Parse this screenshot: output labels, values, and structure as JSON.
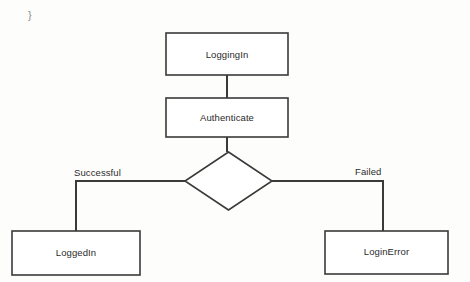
{
  "page": {
    "background_color": "#fdfdfc",
    "stroke_color": "#3a3a3a",
    "text_color": "#2b2b2b",
    "code_fragment_color": "#8b8b8b"
  },
  "code_fragment": {
    "text": "}"
  },
  "diagram": {
    "type": "state-diagram",
    "nodes": [
      {
        "id": "loggingIn",
        "label": "LoggingIn",
        "shape": "rectangle",
        "x": 166,
        "y": 33,
        "width": 122,
        "height": 42
      },
      {
        "id": "authenticate",
        "label": "Authenticate",
        "shape": "rectangle",
        "x": 166,
        "y": 98,
        "width": 122,
        "height": 39
      },
      {
        "id": "decision",
        "label": "",
        "shape": "diamond",
        "x": 185,
        "y": 152,
        "width": 87,
        "height": 58
      },
      {
        "id": "loggedIn",
        "label": "LoggedIn",
        "shape": "rectangle",
        "x": 12,
        "y": 231,
        "width": 128,
        "height": 44
      },
      {
        "id": "loginError",
        "label": "LoginError",
        "shape": "rectangle",
        "x": 325,
        "y": 231,
        "width": 123,
        "height": 43
      }
    ],
    "edges": [
      {
        "id": "edge-loggingin-authenticate",
        "from": "loggingIn",
        "to": "authenticate",
        "label": ""
      },
      {
        "id": "edge-authenticate-decision",
        "from": "authenticate",
        "to": "decision",
        "label": ""
      },
      {
        "id": "edge-decision-loggedin",
        "from": "decision",
        "to": "loggedIn",
        "label": "Successful"
      },
      {
        "id": "edge-decision-loginerror",
        "from": "decision",
        "to": "loginError",
        "label": "Failed"
      }
    ],
    "edge_labels": {
      "successful": "Successful",
      "failed": "Failed"
    }
  }
}
